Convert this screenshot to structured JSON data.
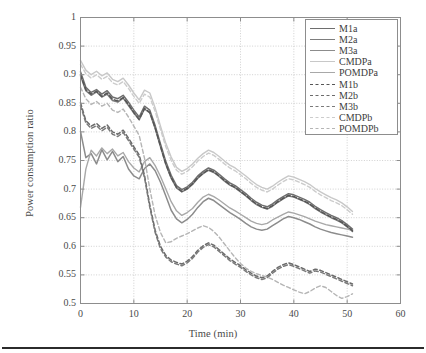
{
  "figure": {
    "ylabel": "Power consumption ratio",
    "xlabel": "Time (min)"
  },
  "chart_data": {
    "type": "line",
    "title": "",
    "xlabel": "Time (min)",
    "ylabel": "Power consumption ratio",
    "xlim": [
      0,
      60
    ],
    "ylim": [
      0.5,
      1
    ],
    "xticks": [
      0,
      10,
      20,
      30,
      40,
      50,
      60
    ],
    "xtick_labels": [
      "0",
      "10",
      "20",
      "30",
      "40",
      "50",
      "60"
    ],
    "yticks": [
      0.5,
      0.55,
      0.6,
      0.65,
      0.7,
      0.75,
      0.8,
      0.85,
      0.9,
      0.95,
      1
    ],
    "ytick_labels": [
      "0.5",
      "0.55",
      "0.6",
      "0.65",
      "0.7",
      "0.75",
      "0.8",
      "0.85",
      "0.9",
      "0.95",
      "1"
    ],
    "grid": true,
    "grid_style": "dotted",
    "legend_position": "top-right",
    "x": [
      0,
      1,
      2,
      3,
      4,
      5,
      6,
      7,
      8,
      9,
      10,
      11,
      12,
      13,
      14,
      15,
      16,
      17,
      18,
      19,
      20,
      21,
      22,
      23,
      24,
      25,
      26,
      27,
      28,
      29,
      30,
      31,
      32,
      33,
      34,
      35,
      36,
      37,
      38,
      39,
      40,
      41,
      42,
      43,
      44,
      45,
      46,
      47,
      48,
      49,
      50,
      51
    ],
    "series": [
      {
        "name": "M1a",
        "color": "#6e6e6e",
        "dash": "solid",
        "width": 1.5,
        "values": [
          0.905,
          0.878,
          0.869,
          0.874,
          0.866,
          0.872,
          0.861,
          0.858,
          0.864,
          0.852,
          0.838,
          0.826,
          0.845,
          0.838,
          0.811,
          0.779,
          0.748,
          0.724,
          0.706,
          0.699,
          0.704,
          0.712,
          0.723,
          0.731,
          0.737,
          0.733,
          0.726,
          0.718,
          0.711,
          0.706,
          0.699,
          0.692,
          0.684,
          0.677,
          0.672,
          0.669,
          0.674,
          0.681,
          0.687,
          0.692,
          0.69,
          0.686,
          0.682,
          0.677,
          0.67,
          0.664,
          0.659,
          0.654,
          0.65,
          0.645,
          0.638,
          0.63
        ]
      },
      {
        "name": "M2a",
        "color": "#7d7d7d",
        "dash": "solid",
        "width": 1.5,
        "values": [
          0.898,
          0.872,
          0.864,
          0.87,
          0.861,
          0.866,
          0.855,
          0.852,
          0.859,
          0.846,
          0.833,
          0.821,
          0.84,
          0.833,
          0.806,
          0.774,
          0.743,
          0.719,
          0.702,
          0.695,
          0.7,
          0.708,
          0.719,
          0.727,
          0.733,
          0.729,
          0.722,
          0.714,
          0.707,
          0.702,
          0.695,
          0.688,
          0.68,
          0.673,
          0.668,
          0.665,
          0.67,
          0.677,
          0.683,
          0.688,
          0.686,
          0.682,
          0.678,
          0.673,
          0.666,
          0.66,
          0.655,
          0.65,
          0.646,
          0.641,
          0.634,
          0.626
        ]
      },
      {
        "name": "M3a",
        "color": "#8c8c8c",
        "dash": "solid",
        "width": 1.5,
        "values": [
          0.801,
          0.755,
          0.762,
          0.744,
          0.769,
          0.751,
          0.766,
          0.748,
          0.757,
          0.735,
          0.723,
          0.718,
          0.736,
          0.744,
          0.732,
          0.712,
          0.688,
          0.663,
          0.648,
          0.641,
          0.647,
          0.656,
          0.668,
          0.678,
          0.684,
          0.68,
          0.673,
          0.666,
          0.659,
          0.653,
          0.647,
          0.64,
          0.634,
          0.63,
          0.628,
          0.63,
          0.636,
          0.642,
          0.648,
          0.652,
          0.65,
          0.647,
          0.643,
          0.639,
          0.634,
          0.63,
          0.627,
          0.624,
          0.622,
          0.62,
          0.618,
          0.616
        ]
      },
      {
        "name": "CMDPa",
        "color": "#c8c8c8",
        "dash": "solid",
        "width": 1.4,
        "values": [
          0.925,
          0.908,
          0.9,
          0.906,
          0.898,
          0.903,
          0.892,
          0.888,
          0.894,
          0.882,
          0.868,
          0.856,
          0.873,
          0.868,
          0.842,
          0.81,
          0.78,
          0.756,
          0.738,
          0.731,
          0.736,
          0.744,
          0.754,
          0.762,
          0.768,
          0.764,
          0.757,
          0.749,
          0.742,
          0.737,
          0.73,
          0.723,
          0.715,
          0.708,
          0.703,
          0.7,
          0.705,
          0.712,
          0.718,
          0.723,
          0.721,
          0.717,
          0.713,
          0.708,
          0.701,
          0.695,
          0.69,
          0.685,
          0.681,
          0.676,
          0.669,
          0.661
        ]
      },
      {
        "name": "POMDPa",
        "color": "#a8a8a8",
        "dash": "solid",
        "width": 1.4,
        "values": [
          0.668,
          0.735,
          0.768,
          0.758,
          0.772,
          0.762,
          0.77,
          0.758,
          0.764,
          0.748,
          0.737,
          0.73,
          0.748,
          0.755,
          0.741,
          0.722,
          0.7,
          0.678,
          0.662,
          0.654,
          0.659,
          0.666,
          0.677,
          0.686,
          0.691,
          0.687,
          0.681,
          0.674,
          0.667,
          0.662,
          0.656,
          0.65,
          0.644,
          0.64,
          0.638,
          0.64,
          0.646,
          0.651,
          0.656,
          0.66,
          0.658,
          0.655,
          0.652,
          0.648,
          0.644,
          0.641,
          0.638,
          0.636,
          0.634,
          0.632,
          0.63,
          0.628
        ]
      },
      {
        "name": "M1b",
        "color": "#555555",
        "dash": "dashed",
        "width": 1.5,
        "values": [
          0.9,
          0.874,
          0.866,
          0.871,
          0.862,
          0.868,
          0.857,
          0.854,
          0.86,
          0.848,
          0.834,
          0.822,
          0.841,
          0.834,
          0.807,
          0.775,
          0.744,
          0.72,
          0.703,
          0.696,
          0.701,
          0.709,
          0.72,
          0.728,
          0.734,
          0.73,
          0.723,
          0.715,
          0.708,
          0.703,
          0.696,
          0.689,
          0.681,
          0.674,
          0.669,
          0.666,
          0.671,
          0.678,
          0.684,
          0.689,
          0.687,
          0.683,
          0.679,
          0.674,
          0.667,
          0.661,
          0.656,
          0.651,
          0.647,
          0.642,
          0.635,
          0.627
        ]
      },
      {
        "name": "M2b",
        "color": "#6b6b6b",
        "dash": "dashed",
        "width": 1.5,
        "values": [
          0.851,
          0.82,
          0.81,
          0.815,
          0.806,
          0.812,
          0.8,
          0.796,
          0.803,
          0.789,
          0.774,
          0.76,
          0.724,
          0.672,
          0.628,
          0.6,
          0.584,
          0.576,
          0.572,
          0.569,
          0.574,
          0.582,
          0.593,
          0.601,
          0.606,
          0.602,
          0.594,
          0.586,
          0.578,
          0.572,
          0.566,
          0.559,
          0.553,
          0.548,
          0.545,
          0.548,
          0.556,
          0.563,
          0.568,
          0.571,
          0.568,
          0.564,
          0.56,
          0.556,
          0.56,
          0.558,
          0.554,
          0.55,
          0.546,
          0.542,
          0.538,
          0.534
        ]
      },
      {
        "name": "M3b",
        "color": "#7a7a7a",
        "dash": "dashed",
        "width": 1.5,
        "values": [
          0.846,
          0.816,
          0.806,
          0.811,
          0.802,
          0.808,
          0.796,
          0.792,
          0.799,
          0.785,
          0.77,
          0.756,
          0.72,
          0.668,
          0.624,
          0.596,
          0.581,
          0.573,
          0.569,
          0.566,
          0.571,
          0.579,
          0.59,
          0.598,
          0.603,
          0.599,
          0.591,
          0.583,
          0.575,
          0.569,
          0.563,
          0.556,
          0.55,
          0.545,
          0.542,
          0.545,
          0.553,
          0.56,
          0.565,
          0.568,
          0.565,
          0.561,
          0.557,
          0.553,
          0.557,
          0.555,
          0.551,
          0.547,
          0.543,
          0.539,
          0.535,
          0.531
        ]
      },
      {
        "name": "CMDPb",
        "color": "#cccccc",
        "dash": "dashed",
        "width": 1.4,
        "values": [
          0.918,
          0.902,
          0.894,
          0.9,
          0.892,
          0.897,
          0.886,
          0.882,
          0.888,
          0.876,
          0.862,
          0.85,
          0.866,
          0.861,
          0.836,
          0.804,
          0.774,
          0.75,
          0.733,
          0.726,
          0.731,
          0.739,
          0.749,
          0.757,
          0.763,
          0.759,
          0.752,
          0.744,
          0.737,
          0.732,
          0.725,
          0.718,
          0.71,
          0.703,
          0.698,
          0.695,
          0.7,
          0.707,
          0.713,
          0.718,
          0.716,
          0.712,
          0.708,
          0.703,
          0.696,
          0.69,
          0.685,
          0.68,
          0.676,
          0.671,
          0.664,
          0.656
        ]
      },
      {
        "name": "POMDPb",
        "color": "#b5b5b5",
        "dash": "dashed",
        "width": 1.4,
        "values": [
          0.878,
          0.858,
          0.848,
          0.853,
          0.845,
          0.85,
          0.838,
          0.834,
          0.84,
          0.826,
          0.81,
          0.794,
          0.754,
          0.7,
          0.654,
          0.624,
          0.606,
          0.608,
          0.614,
          0.618,
          0.622,
          0.627,
          0.632,
          0.636,
          0.633,
          0.626,
          0.616,
          0.604,
          0.592,
          0.58,
          0.57,
          0.562,
          0.556,
          0.552,
          0.549,
          0.546,
          0.542,
          0.537,
          0.532,
          0.528,
          0.524,
          0.52,
          0.517,
          0.521,
          0.527,
          0.531,
          0.528,
          0.521,
          0.514,
          0.509,
          0.512,
          0.517
        ]
      }
    ]
  },
  "legend": {
    "entries": [
      {
        "label": "M1a"
      },
      {
        "label": "M2a"
      },
      {
        "label": "M3a"
      },
      {
        "label": "CMDPa"
      },
      {
        "label": "POMDPa"
      },
      {
        "label": "M1b"
      },
      {
        "label": "M2b"
      },
      {
        "label": "M3b"
      },
      {
        "label": "CMDPb"
      },
      {
        "label": "POMDPb"
      }
    ]
  }
}
